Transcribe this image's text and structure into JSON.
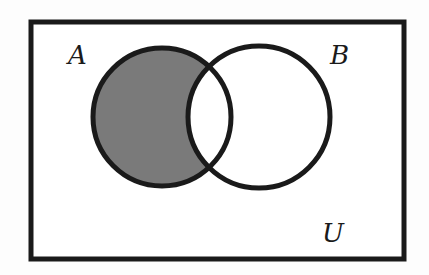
{
  "diagram": {
    "type": "venn",
    "universe_label": "U",
    "sets": [
      {
        "label": "A",
        "shaded": "A minus B"
      },
      {
        "label": "B",
        "shaded": "none"
      }
    ],
    "shaded_region": "A \\ B",
    "colors": {
      "shade": "#7a7a7a",
      "stroke": "#1a1a1a",
      "background": "#ffffff"
    }
  }
}
